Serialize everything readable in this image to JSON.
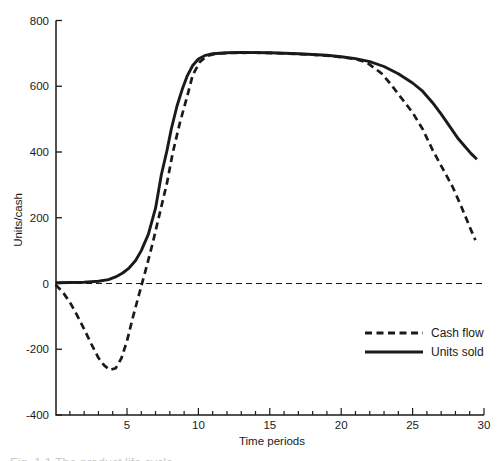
{
  "figure": {
    "background": "#ffffff",
    "ink_color": "#1a1a1a",
    "clipped_caption": "Fig. 1.1 The product life cycle"
  },
  "chart_data": {
    "type": "line",
    "title": "",
    "xlabel": "Time periods",
    "ylabel": "Units/cash",
    "xlim": [
      0,
      30
    ],
    "ylim": [
      -400,
      800
    ],
    "grid": false,
    "x_major_ticks": [
      5,
      10,
      15,
      20,
      25,
      30
    ],
    "x_minor_tick_step": 1,
    "y_ticks": [
      800,
      600,
      400,
      200,
      0,
      -200,
      -400
    ],
    "zero_line": {
      "value": 0,
      "style": "dashed"
    },
    "legend": {
      "position": "lower-right",
      "entries": [
        {
          "label": "Cash flow",
          "style": "dashed"
        },
        {
          "label": "Units sold",
          "style": "solid"
        }
      ]
    },
    "series": [
      {
        "name": "Cash flow",
        "style": "dashed",
        "points": [
          [
            0,
            -4
          ],
          [
            0.5,
            -26
          ],
          [
            1,
            -57
          ],
          [
            1.5,
            -96
          ],
          [
            2,
            -139
          ],
          [
            2.5,
            -184
          ],
          [
            3,
            -226
          ],
          [
            3.4,
            -249
          ],
          [
            3.8,
            -263
          ],
          [
            4.2,
            -258
          ],
          [
            4.6,
            -228
          ],
          [
            5,
            -175
          ],
          [
            5.4,
            -105
          ],
          [
            5.75,
            -48
          ],
          [
            6.05,
            0
          ],
          [
            6.3,
            40
          ],
          [
            6.8,
            123
          ],
          [
            7.3,
            214
          ],
          [
            7.8,
            306
          ],
          [
            8.2,
            397
          ],
          [
            8.7,
            488
          ],
          [
            9.2,
            567
          ],
          [
            9.6,
            634
          ],
          [
            10.1,
            674
          ],
          [
            10.6,
            692
          ],
          [
            11.2,
            699
          ],
          [
            12,
            701
          ],
          [
            14,
            702
          ],
          [
            16,
            700
          ],
          [
            18,
            696
          ],
          [
            19.5,
            691
          ],
          [
            21,
            683
          ],
          [
            21.8,
            672
          ],
          [
            22.8,
            640
          ],
          [
            23.4,
            610
          ],
          [
            24.2,
            565
          ],
          [
            25,
            520
          ],
          [
            25.7,
            470
          ],
          [
            26.4,
            406
          ],
          [
            27.1,
            350
          ],
          [
            27.8,
            294
          ],
          [
            28.4,
            235
          ],
          [
            29,
            172
          ],
          [
            29.4,
            132
          ]
        ]
      },
      {
        "name": "Units sold",
        "style": "solid",
        "points": [
          [
            0,
            2
          ],
          [
            1,
            3
          ],
          [
            2,
            4
          ],
          [
            3,
            7
          ],
          [
            3.7,
            12
          ],
          [
            4.2,
            20
          ],
          [
            4.7,
            32
          ],
          [
            5.1,
            45
          ],
          [
            5.6,
            70
          ],
          [
            6,
            100
          ],
          [
            6.5,
            150
          ],
          [
            7,
            230
          ],
          [
            7.4,
            330
          ],
          [
            7.8,
            405
          ],
          [
            8.1,
            470
          ],
          [
            8.5,
            540
          ],
          [
            8.9,
            595
          ],
          [
            9.2,
            630
          ],
          [
            9.6,
            663
          ],
          [
            10,
            683
          ],
          [
            10.5,
            694
          ],
          [
            11,
            699
          ],
          [
            12,
            702
          ],
          [
            13,
            703
          ],
          [
            15,
            702
          ],
          [
            17,
            699
          ],
          [
            19,
            694
          ],
          [
            20,
            690
          ],
          [
            21,
            684
          ],
          [
            22,
            675
          ],
          [
            23,
            660
          ],
          [
            24,
            638
          ],
          [
            25,
            610
          ],
          [
            25.7,
            585
          ],
          [
            26.4,
            550
          ],
          [
            27,
            515
          ],
          [
            27.6,
            478
          ],
          [
            28.2,
            440
          ],
          [
            28.8,
            410
          ],
          [
            29.1,
            395
          ],
          [
            29.5,
            378
          ]
        ]
      }
    ]
  }
}
